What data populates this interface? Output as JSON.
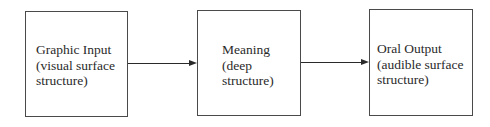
{
  "diagram": {
    "type": "flow",
    "boxes": [
      {
        "lines": [
          "Graphic Input",
          "(visual surface",
          "structure)"
        ]
      },
      {
        "lines": [
          "Meaning",
          "(deep",
          "structure)"
        ]
      },
      {
        "lines": [
          "Oral Output",
          "(audible surface",
          "structure)"
        ]
      }
    ],
    "edges": [
      {
        "from": 0,
        "to": 1
      },
      {
        "from": 1,
        "to": 2
      }
    ]
  }
}
